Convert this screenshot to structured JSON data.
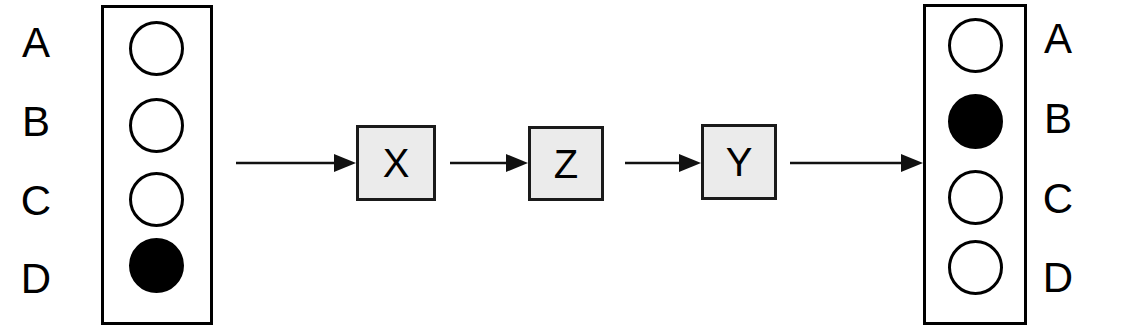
{
  "diagram": {
    "colors": {
      "stroke": "#000000",
      "filled_marker": "#000000",
      "empty_marker": "#ffffff",
      "box_fill": "#ebebeb",
      "background": "#ffffff"
    },
    "initial_state": {
      "name": "initial-state-column",
      "rows": [
        {
          "label": "A",
          "marker": "empty"
        },
        {
          "label": "B",
          "marker": "empty"
        },
        {
          "label": "C",
          "marker": "empty"
        },
        {
          "label": "D",
          "marker": "filled"
        }
      ],
      "label_side": "left"
    },
    "final_state": {
      "name": "final-state-column",
      "rows": [
        {
          "label": "A",
          "marker": "empty"
        },
        {
          "label": "B",
          "marker": "filled"
        },
        {
          "label": "C",
          "marker": "empty"
        },
        {
          "label": "D",
          "marker": "empty"
        }
      ],
      "label_side": "right"
    },
    "operations": [
      {
        "label": "X"
      },
      {
        "label": "Z"
      },
      {
        "label": "Y"
      }
    ],
    "arrows": [
      {
        "name": "arrow-initial-to-x",
        "direction": "right"
      },
      {
        "name": "arrow-x-to-z",
        "direction": "right"
      },
      {
        "name": "arrow-z-to-y",
        "direction": "right"
      },
      {
        "name": "arrow-y-to-final",
        "direction": "right"
      }
    ]
  }
}
